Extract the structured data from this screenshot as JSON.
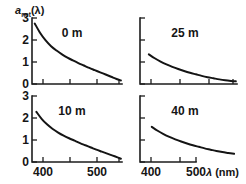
{
  "figure": {
    "ylabel": {
      "symbol": "a",
      "subscript": "net",
      "argument": "(λ)"
    },
    "xlabel": {
      "symbol": "λ",
      "unit": "(nm)"
    },
    "y_tick_labels": [
      "0",
      "1",
      "2",
      "3"
    ],
    "x_tick_labels": [
      "400",
      "500"
    ]
  },
  "chart_data": {
    "type": "line",
    "title": "",
    "xlabel": "λ (nm)",
    "ylabel": "a_net(λ)",
    "xlim": [
      380,
      545
    ],
    "ylim": [
      0,
      3
    ],
    "xticks": [
      400,
      450,
      500,
      540
    ],
    "xtick_labels": [
      "400",
      "",
      "500",
      ""
    ],
    "yticks": [
      0,
      1,
      2,
      3
    ],
    "ytick_labels": [
      "0",
      "1",
      "2",
      "3"
    ],
    "grid": false,
    "legend": "none",
    "panels": [
      {
        "label": "0 m",
        "row": 0,
        "col": 0,
        "show_ylabels": true,
        "show_xlabels": false,
        "x": [
          385,
          395,
          405,
          415,
          425,
          435,
          445,
          455,
          465,
          475,
          485,
          495,
          505,
          515,
          525,
          535,
          543
        ],
        "y": [
          2.75,
          2.32,
          1.98,
          1.72,
          1.52,
          1.35,
          1.2,
          1.07,
          0.95,
          0.84,
          0.73,
          0.63,
          0.53,
          0.43,
          0.33,
          0.23,
          0.16
        ]
      },
      {
        "label": "25 m",
        "row": 0,
        "col": 1,
        "show_ylabels": false,
        "show_xlabels": false,
        "x": [
          395,
          405,
          415,
          425,
          435,
          445,
          455,
          465,
          475,
          485,
          495,
          505,
          515,
          525,
          535,
          543
        ],
        "y": [
          1.35,
          1.17,
          1.02,
          0.89,
          0.78,
          0.68,
          0.59,
          0.51,
          0.44,
          0.37,
          0.31,
          0.26,
          0.21,
          0.17,
          0.14,
          0.12
        ]
      },
      {
        "label": "10 m",
        "row": 1,
        "col": 0,
        "show_ylabels": true,
        "show_xlabels": true,
        "x": [
          388,
          398,
          408,
          418,
          428,
          438,
          448,
          458,
          468,
          478,
          488,
          498,
          508,
          518,
          528,
          538,
          543
        ],
        "y": [
          2.28,
          1.95,
          1.7,
          1.5,
          1.34,
          1.2,
          1.08,
          0.97,
          0.86,
          0.76,
          0.66,
          0.56,
          0.47,
          0.38,
          0.29,
          0.2,
          0.15
        ]
      },
      {
        "label": "40 m",
        "row": 1,
        "col": 1,
        "show_ylabels": false,
        "show_xlabels": true,
        "x": [
          400,
          410,
          420,
          430,
          440,
          450,
          460,
          470,
          480,
          490,
          500,
          510,
          520,
          530,
          540
        ],
        "y": [
          1.6,
          1.42,
          1.27,
          1.14,
          1.03,
          0.93,
          0.84,
          0.76,
          0.69,
          0.62,
          0.56,
          0.5,
          0.45,
          0.41,
          0.37
        ]
      }
    ]
  }
}
